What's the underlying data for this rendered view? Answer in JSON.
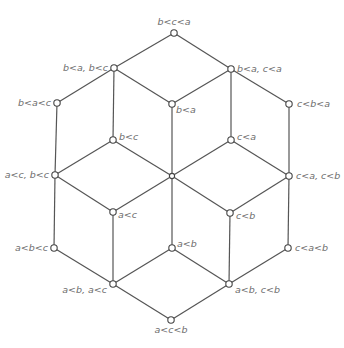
{
  "diagram": {
    "type": "hasse-diagram",
    "colors": {
      "edge": "#555555",
      "node_fill": "#ffffff",
      "node_stroke": "#444444",
      "label": "#6e6e6e"
    },
    "nodes": [
      {
        "id": "n_top",
        "label": "b<c<a",
        "x": 174,
        "y": 33
      },
      {
        "id": "n_ba_bc",
        "label": "b<a, b<c",
        "x": 114,
        "y": 68
      },
      {
        "id": "n_ba_ca",
        "label": "b<a, c<a",
        "x": 231,
        "y": 69
      },
      {
        "id": "n_bac",
        "label": "b<a<c",
        "x": 57,
        "y": 103
      },
      {
        "id": "n_ba",
        "label": "b<a",
        "x": 172,
        "y": 104
      },
      {
        "id": "n_cba",
        "label": "c<b<a",
        "x": 289,
        "y": 104
      },
      {
        "id": "n_bc",
        "label": "b<c",
        "x": 113,
        "y": 140
      },
      {
        "id": "n_ca",
        "label": "c<a",
        "x": 231,
        "y": 140
      },
      {
        "id": "n_ac_bc",
        "label": "a<c, b<c",
        "x": 55,
        "y": 175
      },
      {
        "id": "n_center",
        "label": "",
        "x": 172,
        "y": 176
      },
      {
        "id": "n_ca_cb",
        "label": "c<a, c<b",
        "x": 289,
        "y": 176
      },
      {
        "id": "n_ac",
        "label": "a<c",
        "x": 113,
        "y": 212
      },
      {
        "id": "n_cb",
        "label": "c<b",
        "x": 230,
        "y": 213
      },
      {
        "id": "n_abc",
        "label": "a<b<c",
        "x": 54,
        "y": 248
      },
      {
        "id": "n_ab",
        "label": "a<b",
        "x": 172,
        "y": 248
      },
      {
        "id": "n_cab",
        "label": "c<a<b",
        "x": 288,
        "y": 248
      },
      {
        "id": "n_ab_ac",
        "label": "a<b, a<c",
        "x": 113,
        "y": 284
      },
      {
        "id": "n_ab_cb",
        "label": "a<b, c<b",
        "x": 229,
        "y": 284
      },
      {
        "id": "n_bottom",
        "label": "a<c<b",
        "x": 171,
        "y": 320
      }
    ],
    "labels": {
      "n_top": "b<c<a",
      "n_ba_bc": "b<a, b<c",
      "n_ba_ca": "b<a, c<a",
      "n_bac": "b<a<c",
      "n_ba": "b<a",
      "n_cba": "c<b<a",
      "n_bc": "b<c",
      "n_ca": "c<a",
      "n_ac_bc": "a<c, b<c",
      "n_ca_cb": "c<a, c<b",
      "n_ac": "a<c",
      "n_cb": "c<b",
      "n_abc": "a<b<c",
      "n_ab": "a<b",
      "n_cab": "c<a<b",
      "n_ab_ac": "a<b, a<c",
      "n_ab_cb": "a<b, c<b",
      "n_bottom": "a<c<b"
    },
    "edges": [
      [
        "n_top",
        "n_ba_bc"
      ],
      [
        "n_top",
        "n_ba_ca"
      ],
      [
        "n_ba_bc",
        "n_bac"
      ],
      [
        "n_ba_bc",
        "n_bc"
      ],
      [
        "n_ba_bc",
        "n_ba"
      ],
      [
        "n_ba_ca",
        "n_ba"
      ],
      [
        "n_ba_ca",
        "n_ca"
      ],
      [
        "n_ba_ca",
        "n_cba"
      ],
      [
        "n_bac",
        "n_ac_bc"
      ],
      [
        "n_bc",
        "n_ac_bc"
      ],
      [
        "n_bc",
        "n_center"
      ],
      [
        "n_ba",
        "n_center"
      ],
      [
        "n_ca",
        "n_center"
      ],
      [
        "n_ca",
        "n_ca_cb"
      ],
      [
        "n_cba",
        "n_ca_cb"
      ],
      [
        "n_ac_bc",
        "n_abc"
      ],
      [
        "n_ac_bc",
        "n_ac"
      ],
      [
        "n_center",
        "n_ac"
      ],
      [
        "n_center",
        "n_cb"
      ],
      [
        "n_center",
        "n_ab"
      ],
      [
        "n_ca_cb",
        "n_cb"
      ],
      [
        "n_ca_cb",
        "n_cab"
      ],
      [
        "n_ac",
        "n_ab_ac"
      ],
      [
        "n_cb",
        "n_ab_cb"
      ],
      [
        "n_abc",
        "n_ab_ac"
      ],
      [
        "n_ab",
        "n_ab_ac"
      ],
      [
        "n_ab",
        "n_ab_cb"
      ],
      [
        "n_cab",
        "n_ab_cb"
      ],
      [
        "n_ab_ac",
        "n_bottom"
      ],
      [
        "n_ab_cb",
        "n_bottom"
      ]
    ]
  }
}
